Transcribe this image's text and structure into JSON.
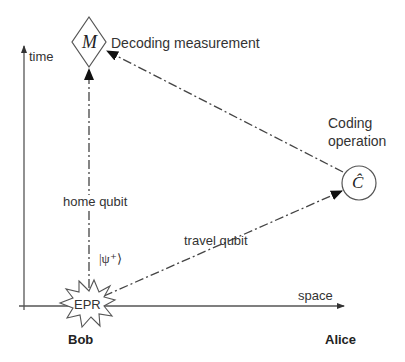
{
  "axes": {
    "vertical_label": "time",
    "horizontal_label": "space"
  },
  "nodes": {
    "measurement": {
      "symbol": "M",
      "label": "Decoding measurement"
    },
    "coding": {
      "symbol": "Ĉ",
      "label_line1": "Coding",
      "label_line2": "operation"
    },
    "source": {
      "symbol": "EPR"
    }
  },
  "edges": {
    "home": "home qubit",
    "travel": "travel qubit",
    "state": "|ψ⁺⟩"
  },
  "parties": {
    "left": "Bob",
    "right": "Alice"
  },
  "colors": {
    "line": "#444444",
    "text": "#333333"
  }
}
